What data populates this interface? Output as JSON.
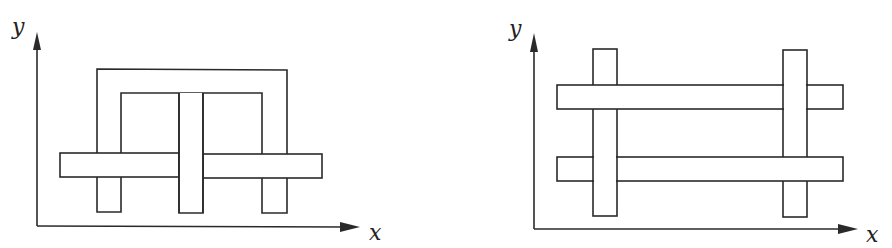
{
  "figures": [
    {
      "name": "left-figure",
      "axes": {
        "x_label": "x",
        "y_label": "y"
      },
      "description": "Pi-shaped frame with a central stem, interlaced with a horizontal bar"
    },
    {
      "name": "right-figure",
      "axes": {
        "x_label": "x",
        "y_label": "y"
      },
      "description": "Two vertical bars woven with two horizontal bars"
    }
  ],
  "colors": {
    "stroke": "#2a2a2a",
    "fill": "#ffffff",
    "background": "#ffffff"
  }
}
